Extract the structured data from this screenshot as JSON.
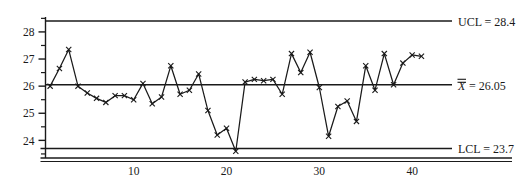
{
  "chart_data": {
    "type": "line",
    "title": "",
    "subtitle": "",
    "xlabel": "",
    "ylabel": "",
    "grid": false,
    "legend_position": "right",
    "marker": "x",
    "xlim": [
      0.5,
      43
    ],
    "ylim": [
      23.35,
      28.55
    ],
    "x_ticks": [
      10,
      20,
      30,
      40
    ],
    "x_tick_labels": [
      "10",
      "20",
      "30",
      "40"
    ],
    "y_ticks": [
      24,
      25,
      26,
      27,
      28
    ],
    "y_tick_labels": [
      "24",
      "25",
      "26",
      "27",
      "28"
    ],
    "y_minor_ticks": [
      23.5,
      24.5,
      25.5,
      26.5,
      27.5,
      28.5
    ],
    "control_limits": {
      "ucl": 28.4,
      "center": 26.05,
      "lcl": 23.7,
      "ucl_label": "UCL = 28.4",
      "center_label_prefix": "X",
      "center_label_value": "= 26.05",
      "lcl_label": "LCL = 23.7"
    },
    "x": [
      1,
      2,
      3,
      4,
      5,
      6,
      7,
      8,
      9,
      10,
      11,
      12,
      13,
      14,
      15,
      16,
      17,
      18,
      19,
      20,
      21,
      22,
      23,
      24,
      25,
      26,
      27,
      28,
      29,
      30,
      31,
      32,
      33,
      34,
      35,
      36,
      37,
      38,
      39,
      40,
      41
    ],
    "series": [
      {
        "name": "Individual measurement",
        "values": [
          26.0,
          26.65,
          27.35,
          26.0,
          25.75,
          25.55,
          25.4,
          25.65,
          25.65,
          25.5,
          26.1,
          25.35,
          25.6,
          26.75,
          25.7,
          25.85,
          26.45,
          25.1,
          24.2,
          24.45,
          23.6,
          26.15,
          26.25,
          26.2,
          26.25,
          25.7,
          27.2,
          26.5,
          27.25,
          25.95,
          24.15,
          25.25,
          25.45,
          24.7,
          26.75,
          25.85,
          27.2,
          26.05,
          26.85,
          27.15,
          27.1
        ]
      }
    ]
  }
}
